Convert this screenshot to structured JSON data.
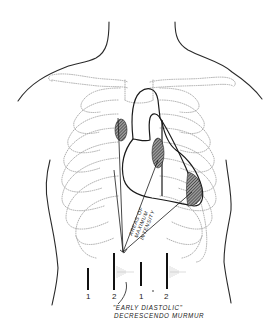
{
  "diagram": {
    "labels": {
      "areas_line1": "AREAS OF",
      "areas_line2": "MAXIMUM",
      "areas_line3": "INTENSITY",
      "caption_line1": "\"EARLY DIASTOLIC\"",
      "caption_line2": "DECRESCENDO MURMUR"
    },
    "heart_sounds": [
      {
        "label": "1",
        "x": 88,
        "top": 268,
        "height": 22
      },
      {
        "label": "2",
        "x": 114,
        "top": 253,
        "height": 37
      },
      {
        "label": "1",
        "x": 141,
        "top": 262,
        "height": 24
      },
      {
        "label": "2",
        "x": 167,
        "top": 253,
        "height": 36
      }
    ],
    "shaded_areas": [
      {
        "name": "aortic-area",
        "cx": 121,
        "cy": 130,
        "rx": 6,
        "ry": 11
      },
      {
        "name": "erb-point-area",
        "cx": 158,
        "cy": 153,
        "rx": 6,
        "ry": 15
      },
      {
        "name": "apex-area",
        "cx": 192,
        "cy": 188,
        "rx": 8,
        "ry": 16
      }
    ],
    "colors": {
      "line": "#1a1a1a",
      "bone": "#9a9a9a",
      "background": "#ffffff"
    }
  }
}
